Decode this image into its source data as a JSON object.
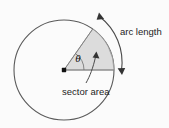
{
  "figure": {
    "type": "geometry-diagram",
    "background_color": "#fbfbfb",
    "labels": {
      "arc_length": "arc length",
      "sector_area": "sector area",
      "angle_symbol": "θ"
    },
    "colors": {
      "outline": "#5a5a5a",
      "sector_fill": "#dcdcdc",
      "sector_stroke": "#8a8a8a",
      "text": "#1d1d1d",
      "center_dot": "#111111",
      "arrow": "#4a4a4a"
    },
    "geometry": {
      "center_x": 64,
      "center_y": 70,
      "radius": 50,
      "sector_start_angle_deg": 0,
      "sector_end_angle_deg": 55,
      "arc_arrow_radius": 58,
      "arc_arrow_double_headed": "true"
    }
  }
}
